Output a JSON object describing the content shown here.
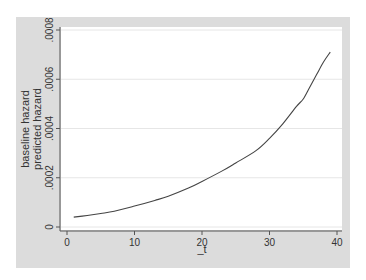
{
  "chart_data": {
    "type": "line",
    "title": "",
    "xlabel": "_t",
    "ylabel": [
      "baseline hazard",
      "predicted hazard"
    ],
    "x_ticks": [
      0,
      10,
      20,
      30,
      40
    ],
    "x_tick_labels": [
      "0",
      "10",
      "20",
      "30",
      "40"
    ],
    "y_ticks": [
      0,
      0.0002,
      0.0004,
      0.0006,
      0.0008
    ],
    "y_tick_labels": [
      "0",
      ".0002",
      ".0004",
      ".0006",
      ".0008"
    ],
    "xlim": [
      0,
      40
    ],
    "ylim": [
      0,
      0.0008
    ],
    "grid": "horizontal",
    "legend": null,
    "series": [
      {
        "name": "predicted hazard",
        "x": [
          1,
          3,
          5,
          7,
          10,
          13,
          15,
          18,
          20,
          23,
          25,
          28,
          30,
          32,
          34,
          35,
          36,
          37,
          38,
          39
        ],
        "values": [
          4e-05,
          4.7e-05,
          5.5e-05,
          6.4e-05,
          8.5e-05,
          0.000108,
          0.000125,
          0.000158,
          0.000185,
          0.000228,
          0.00026,
          0.00031,
          0.00036,
          0.00042,
          0.00049,
          0.00052,
          0.00057,
          0.00062,
          0.00067,
          0.00071
        ],
        "color": "#444444"
      }
    ]
  },
  "colors": {
    "frame_bg": "#dcdcdc",
    "plot_bg": "#ffffff",
    "grid": "#e6e6e6",
    "axis": "#555555",
    "line": "#444444",
    "text": "#333333"
  }
}
